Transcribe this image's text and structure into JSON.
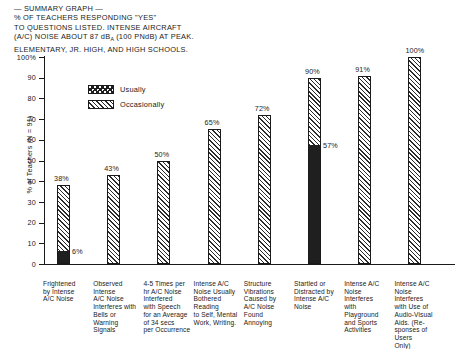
{
  "title": {
    "lines": [
      "— SUMMARY GRAPH —",
      "% OF TEACHERS RESPONDING \"YES\"",
      "TO QUESTIONS LISTED. INTENSE AIRCRAFT",
      "(A/C) NOISE ABOUT 87 dB",
      " (100 PNdB) AT PEAK.",
      "ELEMENTARY, JR. HIGH, AND HIGH SCHOOLS."
    ],
    "line4_sub": "A"
  },
  "legend": {
    "position": "inside-top-left",
    "items": [
      {
        "label": "Usually",
        "pattern": "dotted",
        "swatch_name": "legend-swatch-usually"
      },
      {
        "label": "Occasionally",
        "pattern": "diagonal-hatch",
        "swatch_name": "legend-swatch-occasionally"
      }
    ]
  },
  "chart_data": {
    "type": "bar",
    "title": "% OF TEACHERS RESPONDING \"YES\" TO QUESTIONS LISTED. INTENSE AIRCRAFT (A/C) NOISE ABOUT 87 dBA (100 PNdB) AT PEAK. ELEMENTARY, JR. HIGH, AND HIGH SCHOOLS.",
    "xlabel": "",
    "ylabel": "% of Teachers (N = 91)",
    "ylim": [
      0,
      100
    ],
    "yticks": [
      0,
      10,
      20,
      30,
      40,
      50,
      60,
      70,
      80,
      90,
      100
    ],
    "ytick_labels": [
      "0",
      "10",
      "20",
      "30",
      "40",
      "50",
      "60",
      "70",
      "80",
      "90",
      "100%"
    ],
    "grid": false,
    "stacked_note": "Bars show total 'Occasionally' response; dotted sub-segment from zero shows 'Usually' portion where present.",
    "categories": [
      "Frightened by Intense A/C Noise",
      "Observed Intense A/C Noise Interferes with Bells or Warning Signals",
      "4-5 Times per hr A/C Noise Interfered with Speech for an Average of 34 secs per Occurrence",
      "Intense A/C Noise Usually Bothered Reading to Self, Mental Work, Writing.",
      "Structure Vibrations Caused by A/C Noise Found Annoying",
      "Startled or Distracted by Intense A/C Noise",
      "Intense A/C Noise Interferes with Playground and Sports Activities",
      "Intense A/C Noise Interferes with Use of Audio-Visual Aids. (Responses of Users Only)"
    ],
    "series": [
      {
        "name": "Occasionally",
        "values": [
          38,
          43,
          50,
          65,
          72,
          90,
          91,
          100
        ],
        "labels": [
          "38%",
          "43%",
          "50%",
          "65%",
          "72%",
          "90%",
          "91%",
          "100%"
        ]
      },
      {
        "name": "Usually",
        "values": [
          6,
          null,
          null,
          null,
          null,
          57,
          null,
          null
        ],
        "labels": [
          "6%",
          "",
          "",
          "",
          "",
          "57%",
          "",
          ""
        ]
      }
    ]
  },
  "category_lines": [
    [
      "Frightened",
      "by Intense",
      "A/C Noise"
    ],
    [
      "Observed Intense",
      "A/C Noise",
      "Interferes with",
      "Bells or",
      "Warning Signals"
    ],
    [
      "4-5 Times per",
      "hr A/C Noise",
      "Interfered",
      "with Speech",
      "for an Average",
      "of 34 secs",
      "per Occurrence"
    ],
    [
      "Intense A/C",
      "Noise Usually",
      "Bothered Reading",
      "to Self, Mental",
      "Work, Writing."
    ],
    [
      "Structure",
      "Vibrations",
      "Caused by",
      "A/C Noise",
      "Found",
      "Annoying"
    ],
    [
      "Startled or",
      "Distracted by",
      "Intense A/C",
      "Noise"
    ],
    [
      "Intense A/C",
      "Noise Interferes",
      "with Playground",
      "and Sports",
      "Activities"
    ],
    [
      "Intense A/C",
      "Noise Interferes",
      "with Use of",
      "Audio-Visual",
      "Aids. (Re-",
      "sponses of Users",
      "Only)"
    ]
  ],
  "colors": {
    "ink": "#1a1a1a",
    "paper": "#ffffff",
    "hatch": "#2b2b2b",
    "dot_fill": "#1f1f1f"
  }
}
